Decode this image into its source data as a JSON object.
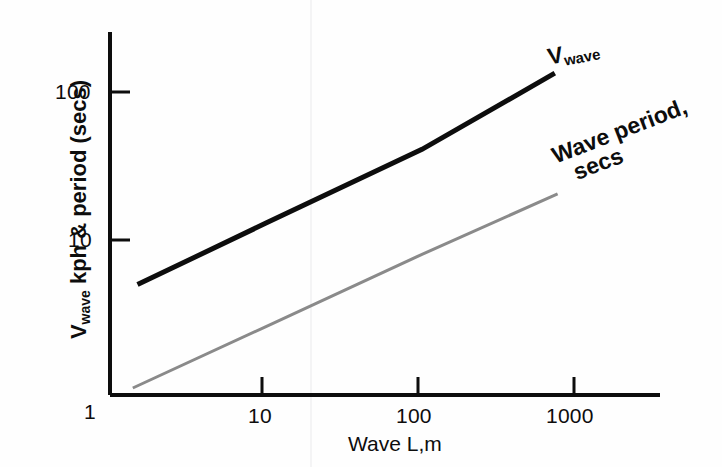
{
  "figure": {
    "background": "#fefefe",
    "ink": "#0d0d0d",
    "secondary_ink": "#8a8a8a"
  },
  "axes": {
    "x": {
      "title": "Wave L,m",
      "tick_labels": [
        "1",
        "10",
        "100",
        "1000"
      ],
      "tick_values": [
        1,
        10,
        100,
        1000
      ],
      "scale": "log"
    },
    "y": {
      "title_main": "V",
      "title_sub": "wave",
      "title_rest": " kph & period (secs)",
      "tick_labels": [
        "1",
        "10",
        "100"
      ],
      "tick_values": [
        1,
        10,
        100
      ],
      "scale": "log"
    }
  },
  "callouts": {
    "vwave": {
      "main": "V",
      "sub": "wave"
    },
    "period": {
      "line1": "Wave period,",
      "line2": "secs"
    }
  },
  "chart_data": {
    "type": "line",
    "title": "",
    "xlabel": "Wave L,m",
    "ylabel": "V wave kph & period (secs)",
    "xscale": "log",
    "yscale": "log",
    "xlim": [
      1,
      4000
    ],
    "ylim": [
      1,
      200
    ],
    "xticks": [
      1,
      10,
      100,
      1000
    ],
    "yticks": [
      1,
      10,
      100
    ],
    "grid": false,
    "legend": "inline annotations at right ends of curves",
    "series": [
      {
        "name": "V_wave",
        "label": "V wave",
        "units": "kph",
        "color": "#0d0d0d",
        "linewidth": 5,
        "points": [
          {
            "x": 1.5,
            "y": 5.0
          },
          {
            "x": 10,
            "y": 13.0
          },
          {
            "x": 100,
            "y": 41.0
          },
          {
            "x": 710,
            "y": 134.0
          }
        ]
      },
      {
        "name": "Wave period",
        "label": "Wave period, secs",
        "units": "secs",
        "color": "#8a8a8a",
        "linewidth": 3,
        "points": [
          {
            "x": 1.4,
            "y": 1.0
          },
          {
            "x": 10,
            "y": 2.6
          },
          {
            "x": 100,
            "y": 8.0
          },
          {
            "x": 740,
            "y": 20.5
          }
        ]
      }
    ]
  }
}
